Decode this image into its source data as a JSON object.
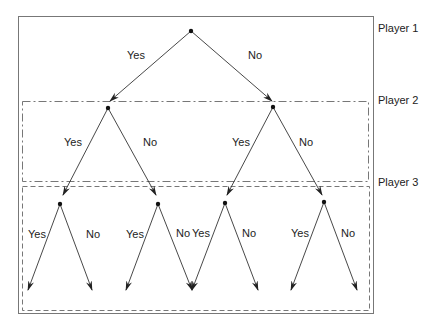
{
  "players": [
    {
      "id": "p1",
      "label": "Player 1"
    },
    {
      "id": "p2",
      "label": "Player 2"
    },
    {
      "id": "p3",
      "label": "Player 3"
    }
  ],
  "nodes": [
    {
      "id": "n1",
      "player": "p1"
    },
    {
      "id": "n2",
      "player": "p2"
    },
    {
      "id": "n3",
      "player": "p2"
    },
    {
      "id": "n4",
      "player": "p3"
    },
    {
      "id": "n5",
      "player": "p3"
    },
    {
      "id": "n6",
      "player": "p3"
    },
    {
      "id": "n7",
      "player": "p3"
    }
  ],
  "edges": [
    {
      "from": "n1",
      "to": "n2",
      "label": "Yes"
    },
    {
      "from": "n1",
      "to": "n3",
      "label": "No"
    },
    {
      "from": "n2",
      "to": "n4",
      "label": "Yes"
    },
    {
      "from": "n2",
      "to": "n5",
      "label": "No"
    },
    {
      "from": "n3",
      "to": "n6",
      "label": "Yes"
    },
    {
      "from": "n3",
      "to": "n7",
      "label": "No"
    },
    {
      "from": "n4",
      "to": "leaf1",
      "label": "Yes"
    },
    {
      "from": "n4",
      "to": "leaf2",
      "label": "No"
    },
    {
      "from": "n5",
      "to": "leaf3",
      "label": "Yes"
    },
    {
      "from": "n5",
      "to": "leaf4",
      "label": "No"
    },
    {
      "from": "n6",
      "to": "leaf5",
      "label": "Yes"
    },
    {
      "from": "n6",
      "to": "leaf6",
      "label": "No"
    },
    {
      "from": "n7",
      "to": "leaf7",
      "label": "Yes"
    },
    {
      "from": "n7",
      "to": "leaf8",
      "label": "No"
    }
  ],
  "colors": {
    "line": "#333333",
    "box": "#777777"
  }
}
